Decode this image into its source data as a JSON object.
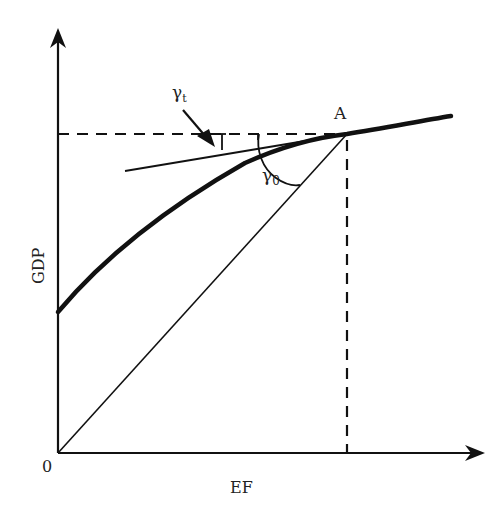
{
  "diagram": {
    "x_axis_label": "EF",
    "y_axis_label": "GDP",
    "origin_label": "0",
    "point_label": "A",
    "angle_tangent": {
      "symbol": "γ",
      "subscript": "t"
    },
    "angle_origin": {
      "symbol": "γ",
      "subscript": "0"
    },
    "colors": {
      "ink": "#111111",
      "background": "#ffffff"
    }
  }
}
